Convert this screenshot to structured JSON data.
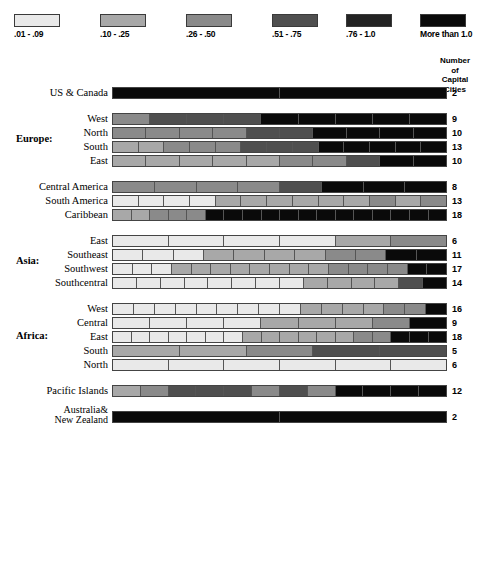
{
  "legend": {
    "items": [
      {
        "label": ".01 - .09",
        "color": "#e9e9e9",
        "x": 14
      },
      {
        "label": ".10 - .25",
        "color": "#a8a8a8",
        "x": 100
      },
      {
        "label": ".26 - .50",
        "color": "#8a8a8a",
        "x": 186
      },
      {
        "label": ".51 - .75",
        "color": "#4f4f4f",
        "x": 272
      },
      {
        "label": ".76 - 1.0",
        "color": "#232323",
        "x": 346
      },
      {
        "label": "More than 1.0",
        "color": "#0a0a0a",
        "x": 420
      }
    ]
  },
  "column_header": {
    "line1": "Number",
    "line2": "of",
    "line3": "Capital",
    "line4": "Cities"
  },
  "groups": {
    "europe": "Europe:",
    "asia": "Asia:",
    "africa": "Africa:"
  },
  "chart_data": {
    "type": "bar",
    "title": "",
    "subtitle": "",
    "xlabel": "",
    "ylabel": "",
    "legend_position": "top",
    "grid": false,
    "note": "Stacked/segmented horizontal bars. Each bar is split into N equal segments where N = number of capital cities in the region; each segment is shaded by its value category from the legend.",
    "categories_legend": [
      ".01 - .09",
      ".10 - .25",
      ".26 - .50",
      ".51 - .75",
      ".76 - 1.0",
      "More than 1.0"
    ],
    "rows": [
      {
        "label": "US & Canada",
        "group": "",
        "count": 2,
        "gap": "none",
        "segments": [
          "More than 1.0",
          "More than 1.0"
        ]
      },
      {
        "label": "West",
        "group": "Europe:",
        "count": 9,
        "gap": "large",
        "segments": [
          ".26 - .50",
          ".51 - .75",
          ".51 - .75",
          ".51 - .75",
          "More than 1.0",
          "More than 1.0",
          "More than 1.0",
          "More than 1.0",
          "More than 1.0"
        ]
      },
      {
        "label": "North",
        "group": "Europe:",
        "count": 10,
        "gap": "none",
        "segments": [
          ".26 - .50",
          ".26 - .50",
          ".26 - .50",
          ".26 - .50",
          ".51 - .75",
          ".51 - .75",
          "More than 1.0",
          "More than 1.0",
          "More than 1.0",
          "More than 1.0"
        ]
      },
      {
        "label": "South",
        "group": "Europe:",
        "count": 13,
        "gap": "none",
        "segments": [
          ".10 - .25",
          ".10 - .25",
          ".26 - .50",
          ".26 - .50",
          ".26 - .50",
          ".51 - .75",
          ".51 - .75",
          ".51 - .75",
          "More than 1.0",
          "More than 1.0",
          "More than 1.0",
          "More than 1.0",
          "More than 1.0"
        ]
      },
      {
        "label": "East",
        "group": "Europe:",
        "count": 10,
        "gap": "none",
        "segments": [
          ".10 - .25",
          ".10 - .25",
          ".10 - .25",
          ".10 - .25",
          ".10 - .25",
          ".26 - .50",
          ".26 - .50",
          ".51 - .75",
          "More than 1.0",
          "More than 1.0"
        ]
      },
      {
        "label": "Central America",
        "group": "",
        "count": 8,
        "gap": "large",
        "segments": [
          ".26 - .50",
          ".26 - .50",
          ".26 - .50",
          ".26 - .50",
          ".51 - .75",
          "More than 1.0",
          "More than 1.0",
          "More than 1.0"
        ]
      },
      {
        "label": "South America",
        "group": "",
        "count": 13,
        "gap": "none",
        "segments": [
          ".01 - .09",
          ".01 - .09",
          ".01 - .09",
          ".01 - .09",
          ".10 - .25",
          ".10 - .25",
          ".10 - .25",
          ".10 - .25",
          ".10 - .25",
          ".10 - .25",
          ".26 - .50",
          ".10 - .25",
          ".26 - .50"
        ]
      },
      {
        "label": "Caribbean",
        "group": "",
        "count": 18,
        "gap": "none",
        "segments": [
          ".10 - .25",
          ".10 - .25",
          ".26 - .50",
          ".26 - .50",
          ".26 - .50",
          "More than 1.0",
          "More than 1.0",
          "More than 1.0",
          "More than 1.0",
          "More than 1.0",
          "More than 1.0",
          "More than 1.0",
          "More than 1.0",
          "More than 1.0",
          "More than 1.0",
          "More than 1.0",
          "More than 1.0",
          "More than 1.0"
        ]
      },
      {
        "label": "East",
        "group": "Asia:",
        "count": 6,
        "gap": "large",
        "segments": [
          ".01 - .09",
          ".01 - .09",
          ".01 - .09",
          ".01 - .09",
          ".10 - .25",
          ".26 - .50"
        ]
      },
      {
        "label": "Southeast",
        "group": "Asia:",
        "count": 11,
        "gap": "none",
        "segments": [
          ".01 - .09",
          ".01 - .09",
          ".01 - .09",
          ".10 - .25",
          ".10 - .25",
          ".10 - .25",
          ".10 - .25",
          ".26 - .50",
          ".26 - .50",
          "More than 1.0",
          "More than 1.0"
        ]
      },
      {
        "label": "Southwest",
        "group": "Asia:",
        "count": 17,
        "gap": "none",
        "segments": [
          ".01 - .09",
          ".01 - .09",
          ".01 - .09",
          ".10 - .25",
          ".10 - .25",
          ".10 - .25",
          ".10 - .25",
          ".10 - .25",
          ".10 - .25",
          ".10 - .25",
          ".10 - .25",
          ".26 - .50",
          ".26 - .50",
          ".26 - .50",
          ".26 - .50",
          "More than 1.0",
          "More than 1.0"
        ]
      },
      {
        "label": "Southcentral",
        "group": "Asia:",
        "count": 14,
        "gap": "none",
        "segments": [
          ".01 - .09",
          ".01 - .09",
          ".01 - .09",
          ".01 - .09",
          ".01 - .09",
          ".01 - .09",
          ".01 - .09",
          ".01 - .09",
          ".10 - .25",
          ".10 - .25",
          ".10 - .25",
          ".10 - .25",
          ".51 - .75",
          "More than 1.0"
        ]
      },
      {
        "label": "West",
        "group": "Africa:",
        "count": 16,
        "gap": "large",
        "segments": [
          ".01 - .09",
          ".01 - .09",
          ".01 - .09",
          ".01 - .09",
          ".01 - .09",
          ".01 - .09",
          ".01 - .09",
          ".01 - .09",
          ".01 - .09",
          ".10 - .25",
          ".10 - .25",
          ".10 - .25",
          ".10 - .25",
          ".26 - .50",
          ".26 - .50",
          "More than 1.0"
        ]
      },
      {
        "label": "Central",
        "group": "Africa:",
        "count": 9,
        "gap": "none",
        "segments": [
          ".01 - .09",
          ".01 - .09",
          ".01 - .09",
          ".01 - .09",
          ".10 - .25",
          ".10 - .25",
          ".10 - .25",
          ".26 - .50",
          "More than 1.0"
        ]
      },
      {
        "label": "East",
        "group": "Africa:",
        "count": 18,
        "gap": "none",
        "segments": [
          ".01 - .09",
          ".01 - .09",
          ".01 - .09",
          ".01 - .09",
          ".01 - .09",
          ".01 - .09",
          ".01 - .09",
          ".10 - .25",
          ".10 - .25",
          ".10 - .25",
          ".10 - .25",
          ".10 - .25",
          ".10 - .25",
          ".26 - .50",
          ".26 - .50",
          "More than 1.0",
          "More than 1.0",
          "More than 1.0"
        ]
      },
      {
        "label": "South",
        "group": "Africa:",
        "count": 5,
        "gap": "none",
        "segments": [
          ".10 - .25",
          ".10 - .25",
          ".26 - .50",
          ".51 - .75",
          ".51 - .75"
        ]
      },
      {
        "label": "North",
        "group": "Africa:",
        "count": 6,
        "gap": "none",
        "segments": [
          ".01 - .09",
          ".01 - .09",
          ".01 - .09",
          ".01 - .09",
          ".01 - .09",
          ".01 - .09"
        ]
      },
      {
        "label": "Pacific Islands",
        "group": "",
        "count": 12,
        "gap": "large",
        "segments": [
          ".10 - .25",
          ".26 - .50",
          ".51 - .75",
          ".51 - .75",
          ".51 - .75",
          ".26 - .50",
          ".51 - .75",
          ".26 - .50",
          "More than 1.0",
          "More than 1.0",
          "More than 1.0",
          "More than 1.0"
        ]
      },
      {
        "label": "Australia&\nNew Zealand",
        "label_line1": "Australia&",
        "label_line2": "New Zealand",
        "group": "",
        "count": 2,
        "gap": "large",
        "segments": [
          "More than 1.0",
          "More than 1.0"
        ]
      }
    ]
  }
}
